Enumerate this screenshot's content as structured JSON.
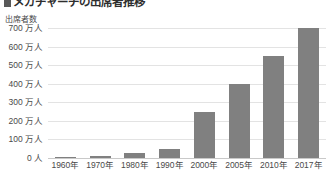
{
  "title": {
    "bullet_marker": "square-bullet",
    "text": "メガチャーチの出席者推移"
  },
  "axis": {
    "y_caption": "出席者数",
    "y_ticks": [
      "700 万人",
      "600 万人",
      "500 万人",
      "400 万人",
      "300 万人",
      "200 万人",
      "100 万人",
      "0 人"
    ],
    "x_ticks": [
      "1960年",
      "1970年",
      "1980年",
      "1990年",
      "2000年",
      "2005年",
      "2010年",
      "2017年"
    ]
  },
  "colors": {
    "bar": "#808080",
    "gridline": "#e3e3e3",
    "axis": "#c9c9c9",
    "text": "#4a4a4a",
    "title": "#2e2e2e"
  },
  "chart_data": {
    "type": "bar",
    "title": "メガチャーチの出席者推移",
    "xlabel": "",
    "ylabel": "出席者数",
    "categories": [
      "1960年",
      "1970年",
      "1980年",
      "1990年",
      "2000年",
      "2005年",
      "2010年",
      "2017年"
    ],
    "values": [
      5,
      10,
      25,
      50,
      250,
      400,
      550,
      700
    ],
    "value_unit": "万人",
    "ylim": [
      0,
      700
    ],
    "ytick_values": [
      0,
      100,
      200,
      300,
      400,
      500,
      600,
      700
    ],
    "ytick_labels": [
      "0 人",
      "100 万人",
      "200 万人",
      "300 万人",
      "400 万人",
      "500 万人",
      "600 万人",
      "700 万人"
    ],
    "grid": true,
    "legend": false,
    "series": [
      {
        "name": "出席者数",
        "values": [
          5,
          10,
          25,
          50,
          250,
          400,
          550,
          700
        ]
      }
    ]
  }
}
